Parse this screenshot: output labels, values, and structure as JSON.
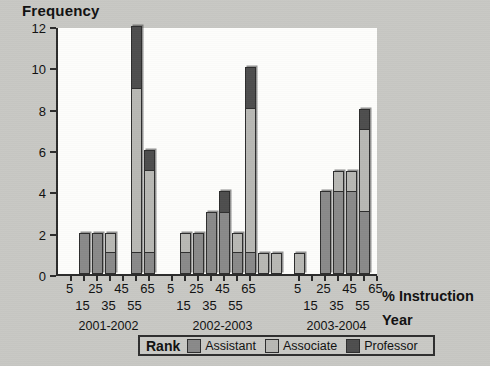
{
  "chart_data": {
    "type": "bar",
    "subtype": "stacked-bar-grouped",
    "title": "",
    "ylabel": "Frequency",
    "xlabel": "% Instruction",
    "xlabel2": "Year",
    "ylim": [
      0,
      12
    ],
    "yticks": [
      0,
      2,
      4,
      6,
      8,
      10,
      12
    ],
    "grid": false,
    "legend_title": "Rank",
    "legend_position": "bottom",
    "series": [
      {
        "name": "Assistant",
        "color": "#8a8a8a"
      },
      {
        "name": "Associate",
        "color": "#b8b8b4"
      },
      {
        "name": "Professor",
        "color": "#4e4e4e"
      }
    ],
    "groups": [
      {
        "label": "2001-2002",
        "categories": [
          "5",
          "15",
          "25",
          "35",
          "45",
          "55",
          "65"
        ],
        "bars": [
          {
            "x": "5",
            "Assistant": 0,
            "Associate": 0,
            "Professor": 0,
            "total": 0
          },
          {
            "x": "15",
            "Assistant": 2,
            "Associate": 0,
            "Professor": 0,
            "total": 2
          },
          {
            "x": "25",
            "Assistant": 2,
            "Associate": 0,
            "Professor": 0,
            "total": 2
          },
          {
            "x": "35",
            "Assistant": 1,
            "Associate": 1,
            "Professor": 0,
            "total": 2
          },
          {
            "x": "45",
            "Assistant": 0,
            "Associate": 0,
            "Professor": 0,
            "total": 0
          },
          {
            "x": "55",
            "Assistant": 1,
            "Associate": 8,
            "Professor": 3,
            "total": 12
          },
          {
            "x": "65",
            "Assistant": 1,
            "Associate": 4,
            "Professor": 1,
            "total": 6
          }
        ]
      },
      {
        "label": "2002-2003",
        "categories": [
          "5",
          "15",
          "25",
          "35",
          "45",
          "55",
          "65"
        ],
        "bars": [
          {
            "x": "5",
            "Assistant": 0,
            "Associate": 0,
            "Professor": 0,
            "total": 0
          },
          {
            "x": "15",
            "Assistant": 1,
            "Associate": 1,
            "Professor": 0,
            "total": 2
          },
          {
            "x": "25",
            "Assistant": 2,
            "Associate": 0,
            "Professor": 0,
            "total": 2
          },
          {
            "x": "35",
            "Assistant": 3,
            "Associate": 0,
            "Professor": 0,
            "total": 3
          },
          {
            "x": "45",
            "Assistant": 3,
            "Associate": 0,
            "Professor": 1,
            "total": 4
          },
          {
            "x": "55",
            "Assistant": 1,
            "Associate": 1,
            "Professor": 0,
            "total": 2
          },
          {
            "x": "65",
            "Assistant": 1,
            "Associate": 7,
            "Professor": 2,
            "total": 10
          }
        ]
      },
      {
        "label": "2003-2004",
        "categories": [
          "5",
          "15",
          "25",
          "35",
          "45",
          "55",
          "65"
        ],
        "bars": [
          {
            "x": "5",
            "Assistant": 0,
            "Associate": 1,
            "Professor": 0,
            "total": 1
          },
          {
            "x": "15",
            "Assistant": 0,
            "Associate": 0,
            "Professor": 0,
            "total": 0
          },
          {
            "x": "25",
            "Assistant": 4,
            "Associate": 0,
            "Professor": 0,
            "total": 4
          },
          {
            "x": "35",
            "Assistant": 4,
            "Associate": 1,
            "Professor": 0,
            "total": 5
          },
          {
            "x": "45",
            "Assistant": 4,
            "Associate": 1,
            "Professor": 0,
            "total": 5
          },
          {
            "x": "55",
            "Assistant": 3,
            "Associate": 4,
            "Professor": 1,
            "total": 8
          },
          {
            "x": "65",
            "Assistant": 0,
            "Associate": 0,
            "Professor": 0,
            "total": 0
          }
        ]
      }
    ],
    "trailing_bars": [
      {
        "after_group": "2002-2003",
        "Assistant": 0,
        "Associate": 1,
        "Professor": 0,
        "total": 1
      },
      {
        "after_group": "2002-2003",
        "Assistant": 0,
        "Associate": 1,
        "Professor": 0,
        "total": 1
      }
    ]
  },
  "colors": {
    "background": "#c8c8c4",
    "plot_background": "#fdfdfb",
    "axis": "#2c2c2c",
    "text": "#111111"
  }
}
